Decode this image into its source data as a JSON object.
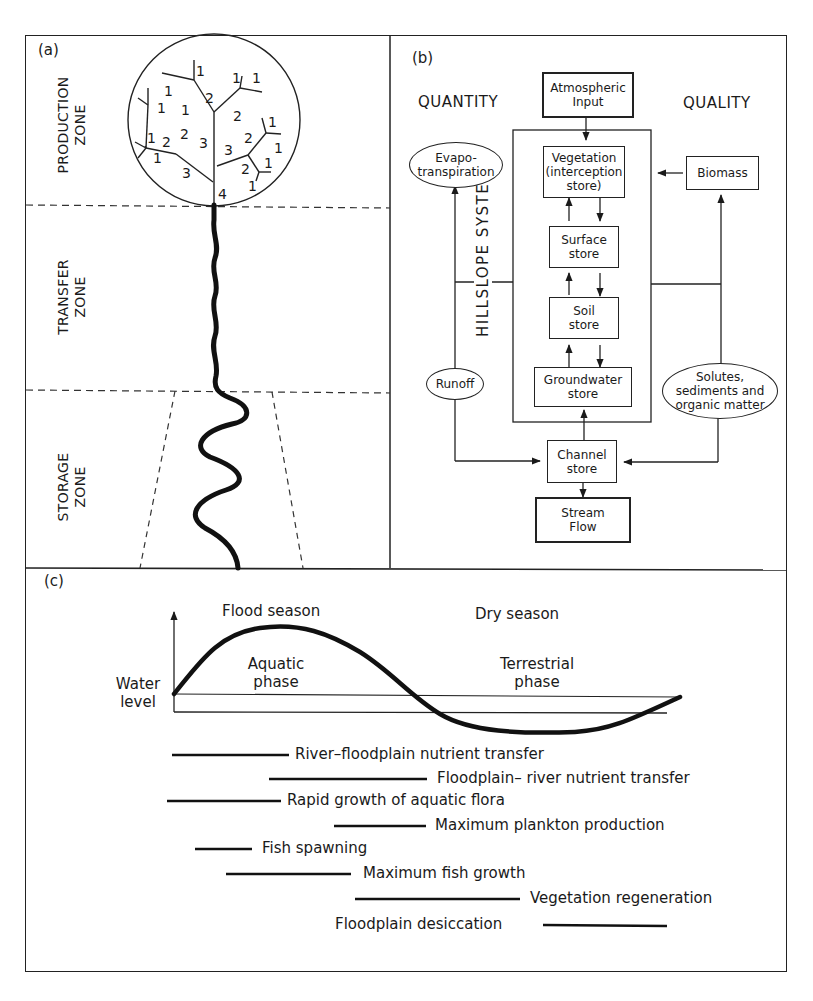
{
  "panels": {
    "a": {
      "tag": "(a)",
      "zones": [
        {
          "line1": "PRODUCTION",
          "line2": "ZONE"
        },
        {
          "line1": "TRANSFER",
          "line2": "ZONE"
        },
        {
          "line1": "STORAGE",
          "line2": "ZONE"
        }
      ],
      "stream_orders": {
        "order1": "1",
        "order2": "2",
        "order3": "3",
        "order4": "4"
      }
    },
    "b": {
      "tag": "(b)",
      "heading_left": "QUANTITY",
      "heading_right": "QUALITY",
      "system_label": "HILLSLOPE SYSTEM",
      "nodes": {
        "atmospheric": {
          "line1": "Atmospheric",
          "line2": "Input"
        },
        "vegetation": {
          "line1": "Vegetation",
          "line2": "(interception",
          "line3": "store)"
        },
        "surface": {
          "line1": "Surface",
          "line2": "store"
        },
        "soil": {
          "line1": "Soil",
          "line2": "store"
        },
        "groundwater": {
          "line1": "Groundwater",
          "line2": "store"
        },
        "channel": {
          "line1": "Channel",
          "line2": "store"
        },
        "stream": {
          "line1": "Stream",
          "line2": "Flow"
        },
        "evapo": {
          "line1": "Evapo-",
          "line2": "transpiration"
        },
        "runoff": {
          "line1": "Runoff"
        },
        "biomass": {
          "line1": "Biomass"
        },
        "solutes": {
          "line1": "Solutes,",
          "line2": "sediments and",
          "line3": "organic matter"
        }
      }
    },
    "c": {
      "tag": "(c)",
      "y_axis_label": {
        "line1": "Water",
        "line2": "level"
      },
      "season_left": "Flood season",
      "season_right": "Dry season",
      "phase_left": {
        "line1": "Aquatic",
        "line2": "phase"
      },
      "phase_right": {
        "line1": "Terrestrial",
        "line2": "phase"
      },
      "events": [
        {
          "label": "River–floodplain nutrient transfer"
        },
        {
          "label": "Floodplain– river nutrient transfer"
        },
        {
          "label": "Rapid growth of aquatic flora"
        },
        {
          "label": "Maximum plankton production"
        },
        {
          "label": "Fish spawning"
        },
        {
          "label": "Maximum fish growth"
        },
        {
          "label": "Vegetation regeneration"
        },
        {
          "label": "Floodplain desiccation"
        }
      ]
    }
  },
  "colors": {
    "ink": "#1a1a1a",
    "paper": "#ffffff"
  }
}
